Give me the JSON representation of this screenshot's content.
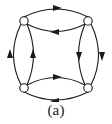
{
  "figure": {
    "caption": "(a)",
    "title": "",
    "kind": "directed-multigraph-diagram",
    "stroke_color": "#1a1a1a",
    "node_fill_color": "#ffffff",
    "background_color": "#ffffff",
    "stroke_width": 1.1,
    "node_radius": 4.2
  },
  "nodes": [
    {
      "id": "top-left",
      "label": "",
      "x": 24,
      "y": 21
    },
    {
      "id": "top-right",
      "label": "",
      "x": 88,
      "y": 21
    },
    {
      "id": "bottom-left",
      "label": "",
      "x": 24,
      "y": 88
    },
    {
      "id": "bottom-right",
      "label": "",
      "x": 88,
      "y": 88
    }
  ],
  "edges": [
    {
      "id": "top-outer",
      "from": "top-left",
      "to": "top-right",
      "bulge": "up",
      "arrow": "right",
      "arrow_x": 56,
      "arrow_y": 9
    },
    {
      "id": "top-inner",
      "from": "top-right",
      "to": "top-left",
      "bulge": "down",
      "arrow": "left",
      "arrow_x": 56,
      "arrow_y": 31
    },
    {
      "id": "bottom-inner",
      "from": "bottom-left",
      "to": "bottom-right",
      "bulge": "up",
      "arrow": "right",
      "arrow_x": 56,
      "arrow_y": 78
    },
    {
      "id": "bottom-outer",
      "from": "bottom-right",
      "to": "bottom-left",
      "bulge": "down",
      "arrow": "left",
      "arrow_x": 56,
      "arrow_y": 100
    },
    {
      "id": "left-outer",
      "from": "bottom-left",
      "to": "top-left",
      "bulge": "left",
      "arrow": "up",
      "arrow_x": 12,
      "arrow_y": 55
    },
    {
      "id": "left-inner",
      "from": "bottom-left",
      "to": "top-left",
      "bulge": "right",
      "arrow": "up",
      "arrow_x": 34,
      "arrow_y": 55
    },
    {
      "id": "right-outer",
      "from": "top-right",
      "to": "bottom-right",
      "bulge": "right",
      "arrow": "down",
      "arrow_x": 100,
      "arrow_y": 55
    },
    {
      "id": "right-inner",
      "from": "top-right",
      "to": "bottom-right",
      "bulge": "left",
      "arrow": "down",
      "arrow_x": 78,
      "arrow_y": 55
    }
  ]
}
